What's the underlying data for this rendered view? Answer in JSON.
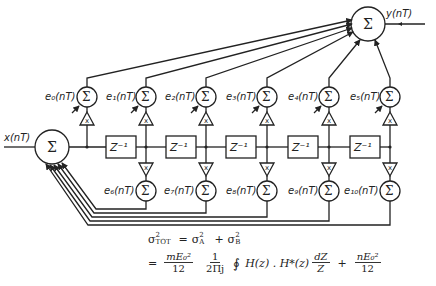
{
  "diagram": {
    "input_label": "x(nT)",
    "output_label": "y(nT)",
    "summer_symbol": "Σ",
    "multiplier_symbol": "x",
    "delay_label": "Z⁻¹",
    "top_error_sources": [
      "e₀(nT)",
      "e₁(nT)",
      "e₂(nT)",
      "e₃(nT)",
      "e₄(nT)",
      "e₅(nT)"
    ],
    "bottom_error_sources": [
      "e₆(nT)",
      "e₇(nT)",
      "e₈(nT)",
      "e₉(nT)",
      "e₁₀(nT)"
    ],
    "delay_count": 5
  },
  "formula": {
    "line1_lhs": "σ",
    "line1_lhs_sup": "2",
    "line1_lhs_sub": "TOT",
    "line1_eq": "=",
    "line1_a": "σ",
    "line1_a_sup": "2",
    "line1_a_sub": "A",
    "line1_plus": "+",
    "line1_b": "σ",
    "line1_b_sup": "2",
    "line1_b_sub": "B",
    "line2_eq": "=",
    "frac1_num": "mE₀²",
    "frac1_den": "12",
    "frac2_num": "1",
    "frac2_den": "2Πj",
    "integral": "∮",
    "integrand": "H(z) . H*(z)",
    "frac3_num": "dZ",
    "frac3_den": "Z",
    "plus": "+",
    "frac4_num": "nE₀²",
    "frac4_den": "12"
  }
}
